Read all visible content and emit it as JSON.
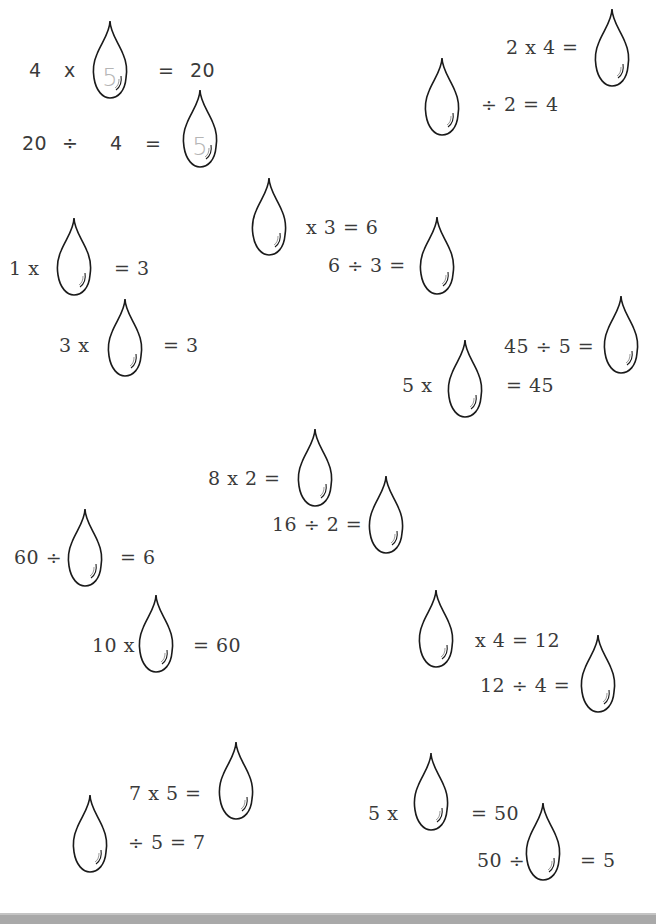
{
  "worksheet": {
    "problems": [
      {
        "id": "p1",
        "parts": [
          "4",
          "x",
          "",
          "=",
          "20"
        ],
        "answer": "5"
      },
      {
        "id": "p2",
        "parts": [
          "20",
          "÷",
          "4",
          "=",
          ""
        ],
        "answer": "5"
      },
      {
        "id": "p3",
        "parts": [
          "2",
          "x",
          "4",
          "=",
          ""
        ],
        "answer": ""
      },
      {
        "id": "p4",
        "parts": [
          "",
          "÷",
          "2",
          "=",
          "4"
        ],
        "answer": ""
      },
      {
        "id": "p5",
        "parts": [
          "",
          "x",
          "3",
          "=",
          "6"
        ],
        "answer": ""
      },
      {
        "id": "p6",
        "parts": [
          "6",
          "÷",
          "3",
          "=",
          ""
        ],
        "answer": ""
      },
      {
        "id": "p7",
        "parts": [
          "1",
          "x",
          "",
          "=",
          "3"
        ],
        "answer": ""
      },
      {
        "id": "p8",
        "parts": [
          "3",
          "x",
          "",
          "=",
          "3"
        ],
        "answer": ""
      },
      {
        "id": "p9",
        "parts": [
          "45",
          "÷",
          "5",
          "=",
          ""
        ],
        "answer": ""
      },
      {
        "id": "p10",
        "parts": [
          "5",
          "x",
          "",
          "=",
          "45"
        ],
        "answer": ""
      },
      {
        "id": "p11",
        "parts": [
          "8",
          "x",
          "2",
          "=",
          ""
        ],
        "answer": ""
      },
      {
        "id": "p12",
        "parts": [
          "16",
          "÷",
          "2",
          "=",
          ""
        ],
        "answer": ""
      },
      {
        "id": "p13",
        "parts": [
          "60",
          "÷",
          "",
          "=",
          "6"
        ],
        "answer": ""
      },
      {
        "id": "p14",
        "parts": [
          "10",
          "x",
          "",
          "=",
          "60"
        ],
        "answer": ""
      },
      {
        "id": "p15",
        "parts": [
          "",
          "x",
          "4",
          "=",
          "12"
        ],
        "answer": ""
      },
      {
        "id": "p16",
        "parts": [
          "12",
          "÷",
          "4",
          "=",
          ""
        ],
        "answer": ""
      },
      {
        "id": "p17",
        "parts": [
          "7",
          "x",
          "5",
          "=",
          ""
        ],
        "answer": ""
      },
      {
        "id": "p18",
        "parts": [
          "",
          "÷",
          "5",
          "=",
          "7"
        ],
        "answer": ""
      },
      {
        "id": "p19",
        "parts": [
          "5",
          "x",
          "",
          "=",
          "50"
        ],
        "answer": ""
      },
      {
        "id": "p20",
        "parts": [
          "50",
          "÷",
          "",
          "=",
          "5"
        ],
        "answer": ""
      }
    ],
    "text": {
      "p1a": "4",
      "p1b": "x",
      "p1c": "=",
      "p1d": "20",
      "p2a": "20",
      "p2b": "÷",
      "p2c": "4",
      "p2d": "=",
      "p3": "2  x  4  =",
      "p4": "÷  2  =  4",
      "p5": "x  3  =  6",
      "p6": "6  ÷  3  =",
      "p7a": "1  x",
      "p7b": "=  3",
      "p8a": "3  x",
      "p8b": "=  3",
      "p9": "45  ÷  5  =",
      "p10a": "5  x",
      "p10b": "=  45",
      "p11": "8  x  2  =",
      "p12": "16 ÷  2  =",
      "p13a": "60  ÷",
      "p13b": "=  6",
      "p14a": "10  x",
      "p14b": "=  60",
      "p15": "x  4  = 12",
      "p16": "12  ÷  4  =",
      "p17": "7  x  5  =",
      "p18": "÷  5  =  7",
      "p19a": "5  x",
      "p19b": "=  50",
      "p20a": "50  ÷",
      "p20b": "=  5"
    },
    "answers": {
      "p1": "5",
      "p2": "5"
    }
  },
  "colors": {
    "ink": "#1a1a1a",
    "text": "#3a3a3a",
    "hint": "#b5b5b5",
    "footer": "#a9a9a9"
  }
}
